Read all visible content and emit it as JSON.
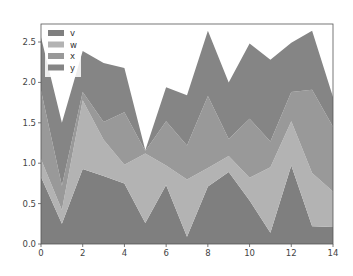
{
  "chart_data": {
    "type": "area",
    "stacked": true,
    "title": "",
    "xlabel": "",
    "ylabel": "",
    "x": [
      0,
      1,
      2,
      3,
      4,
      5,
      6,
      7,
      8,
      9,
      10,
      11,
      12,
      13,
      14
    ],
    "xlim": [
      0,
      14
    ],
    "ylim": [
      0,
      2.7
    ],
    "xticks": [
      0,
      2,
      4,
      6,
      8,
      10,
      12,
      14
    ],
    "xtick_labels": [
      "0",
      "2",
      "4",
      "6",
      "8",
      "10",
      "12",
      "14"
    ],
    "yticks": [
      0.0,
      0.5,
      1.0,
      1.5,
      2.0,
      2.5
    ],
    "ytick_labels": [
      "0.0",
      "0.5",
      "1.0",
      "1.5",
      "2.0",
      "2.5"
    ],
    "grid": false,
    "legend_position": "upper left",
    "series": [
      {
        "name": "v",
        "color": "#7f7f7f",
        "values": [
          0.83,
          0.25,
          0.93,
          0.84,
          0.75,
          0.26,
          0.73,
          0.09,
          0.71,
          0.89,
          0.54,
          0.14,
          0.97,
          0.22,
          0.21
        ]
      },
      {
        "name": "w",
        "color": "#b3b3b3",
        "values": [
          0.22,
          0.17,
          0.85,
          0.45,
          0.23,
          0.86,
          0.24,
          0.71,
          0.23,
          0.2,
          0.28,
          0.81,
          0.55,
          0.66,
          0.44
        ]
      },
      {
        "name": "x",
        "color": "#999999",
        "values": [
          0.85,
          0.3,
          0.1,
          0.22,
          0.65,
          0.03,
          0.55,
          0.42,
          0.89,
          0.21,
          0.73,
          0.32,
          0.36,
          1.03,
          0.8
        ]
      },
      {
        "name": "y",
        "color": "#858585",
        "values": [
          0.66,
          0.78,
          0.51,
          0.73,
          0.55,
          0.01,
          0.42,
          0.62,
          0.81,
          0.7,
          0.93,
          1.01,
          0.61,
          0.73,
          0.37
        ]
      }
    ]
  }
}
